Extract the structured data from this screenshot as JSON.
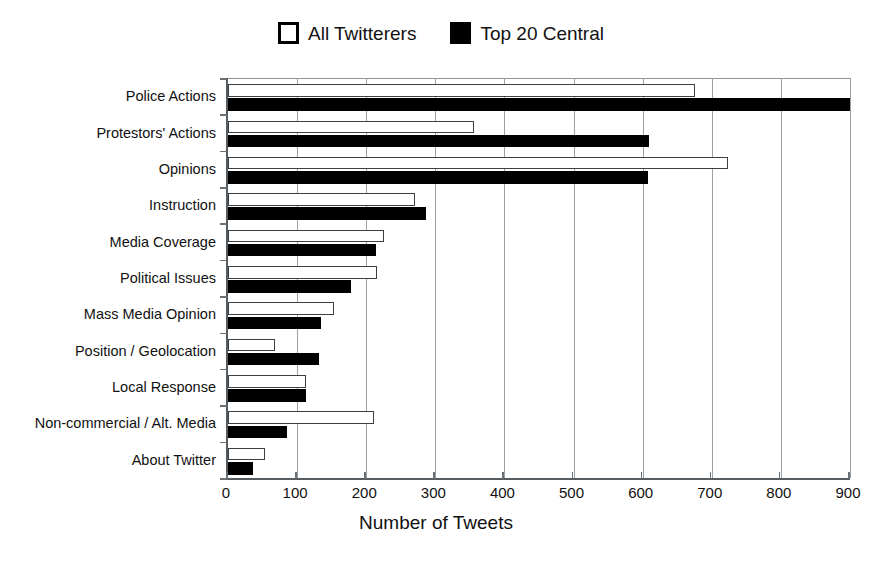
{
  "figure": {
    "clipped_caption": "",
    "x_axis_title": "Number of Tweets",
    "y_axis_title": ""
  },
  "legend": {
    "position": "top-center",
    "entries": [
      {
        "label": "All Twitterers",
        "swatch": "open-square-icon",
        "color": "#ffffff",
        "edge": "#000000"
      },
      {
        "label": "Top 20 Central",
        "swatch": "filled-square-icon",
        "color": "#000000",
        "edge": "#000000"
      }
    ]
  },
  "chart_data": {
    "type": "bar",
    "orientation": "horizontal",
    "title": "",
    "subtitle": "",
    "xlabel": "Number of Tweets",
    "ylabel": "",
    "xlim": [
      0,
      900
    ],
    "ylim": null,
    "grid": "vertical",
    "legend_position": "top-center",
    "categories": [
      "Police Actions",
      "Protestors' Actions",
      "Opinions",
      "Instruction",
      "Media Coverage",
      "Political Issues",
      "Mass Media Opinion",
      "Position / Geolocation",
      "Local Response",
      "Non-commercial / Alt. Media",
      "About Twitter"
    ],
    "xticks": [
      0,
      100,
      200,
      300,
      400,
      500,
      600,
      700,
      800,
      900
    ],
    "xtick_labels": [
      "0",
      "100",
      "200",
      "300",
      "400",
      "500",
      "600",
      "700",
      "800",
      "900"
    ],
    "series": [
      {
        "name": "All Twitterers",
        "color": "#ffffff",
        "edgecolor": "#000000",
        "values": [
          675,
          356,
          724,
          271,
          226,
          216,
          153,
          68,
          113,
          211,
          53
        ]
      },
      {
        "name": "Top 20 Central",
        "color": "#000000",
        "edgecolor": "#000000",
        "values": [
          900,
          609,
          608,
          287,
          214,
          178,
          135,
          131,
          113,
          85,
          36
        ]
      }
    ]
  }
}
